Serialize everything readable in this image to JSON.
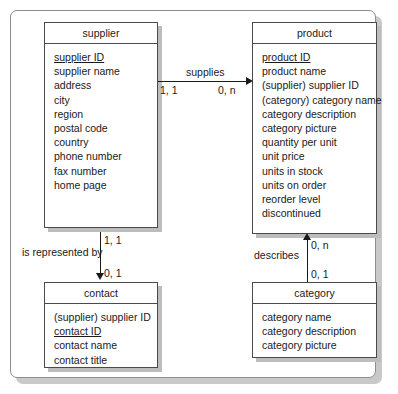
{
  "diagram": {
    "entities": [
      {
        "id": "supplier",
        "name": "supplier",
        "attributes": [
          {
            "label": "supplier ID",
            "key": true
          },
          {
            "label": "supplier name",
            "key": false
          },
          {
            "label": "address",
            "key": false
          },
          {
            "label": "city",
            "key": false
          },
          {
            "label": "region",
            "key": false
          },
          {
            "label": "postal code",
            "key": false
          },
          {
            "label": "country",
            "key": false
          },
          {
            "label": "phone number",
            "key": false
          },
          {
            "label": "fax number",
            "key": false
          },
          {
            "label": "home page",
            "key": false
          }
        ]
      },
      {
        "id": "product",
        "name": "product",
        "attributes": [
          {
            "label": "product ID",
            "key": true
          },
          {
            "label": "product name",
            "key": false
          },
          {
            "label": "(supplier) supplier ID",
            "key": false
          },
          {
            "label": "(category) category name",
            "key": false
          },
          {
            "label": "category description",
            "key": false
          },
          {
            "label": "category picture",
            "key": false
          },
          {
            "label": "quantity per unit",
            "key": false
          },
          {
            "label": "unit price",
            "key": false
          },
          {
            "label": "units in stock",
            "key": false
          },
          {
            "label": "units on order",
            "key": false
          },
          {
            "label": "reorder level",
            "key": false
          },
          {
            "label": "discontinued",
            "key": false
          }
        ]
      },
      {
        "id": "contact",
        "name": "contact",
        "attributes": [
          {
            "label": "(supplier) supplier ID",
            "key": false
          },
          {
            "label": "contact ID",
            "key": true
          },
          {
            "label": "contact name",
            "key": false
          },
          {
            "label": "contact title",
            "key": false
          }
        ]
      },
      {
        "id": "category",
        "name": "category",
        "attributes": [
          {
            "label": "category name",
            "key": false
          },
          {
            "label": "category description",
            "key": false
          },
          {
            "label": "category picture",
            "key": false
          }
        ]
      }
    ],
    "relationships": [
      {
        "id": "supplies",
        "label": "supplies",
        "from": "supplier",
        "to": "product",
        "direction": "right",
        "source_cardinality": "1, 1",
        "target_cardinality": "0, n"
      },
      {
        "id": "is-represented-by",
        "label": "is represented by",
        "from": "supplier",
        "to": "contact",
        "direction": "down",
        "source_cardinality": "1, 1",
        "target_cardinality": "0, 1"
      },
      {
        "id": "describes",
        "label": "describes",
        "from": "category",
        "to": "product",
        "direction": "up",
        "source_cardinality": "0, n",
        "target_cardinality": "0, 1"
      }
    ]
  }
}
